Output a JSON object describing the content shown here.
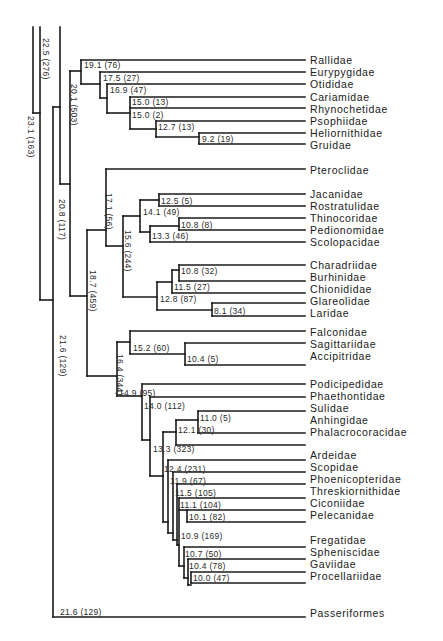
{
  "figure": {
    "type": "phylogenetic-tree",
    "taxa": [
      "Rallidae",
      "Eurypygidae",
      "Otididae",
      "Cariamidae",
      "Rhynochetidae",
      "Psophiidae",
      "Heliornithidae",
      "Gruidae",
      "Pteroclidae",
      "Jacanidae",
      "Rostratulidae",
      "Thinocoridae",
      "Pedionomidae",
      "Scolopacidae",
      "Charadriidae",
      "Burhinidae",
      "Chionididae",
      "Glareolidae",
      "Laridae",
      "Falconidae",
      "Sagittariidae",
      "Accipitridae",
      "Podicipedidae",
      "Phaethontidae",
      "Sulidae",
      "Anhingidae",
      "Phalacrocoracidae",
      "Ardeidae",
      "Scopidae",
      "Phoenicopteridae",
      "Threskiornithidae",
      "Ciconiidae",
      "Pelecanidae",
      "Fregatidae",
      "Spheniscidae",
      "Gaviidae",
      "Procellariidae",
      "Passeriformes"
    ],
    "node_labels": {
      "n191": "19.1 (76)",
      "n175": "17.5 (27)",
      "n169": "16.9 (47)",
      "n150a": "15.0 (13)",
      "n150b": "15.0 (2)",
      "n127": "12.7 (13)",
      "n92": "9.2 (19)",
      "n201": "20.1 (503)",
      "n225": "22.5 (276)",
      "n231": "23.1 (163)",
      "n208": "20.8 (117)",
      "n171": "17.1 (56)",
      "n156": "15.6 (244)",
      "n125": "12.5 (5)",
      "n141": "14.1 (49)",
      "n108a": "10.8 (8)",
      "n133a": "13.3 (46)",
      "n108b": "10.8 (32)",
      "n115a": "11.5 (27)",
      "n128": "12.8 (87)",
      "n81": "8.1 (34)",
      "n187": "18.7 (459)",
      "n152": "15.2 (60)",
      "n104a": "10.4 (5)",
      "n164": "16.4 (344)",
      "n149": "14.9 (95)",
      "n140": "14.0 (112)",
      "n110": "11.0 (5)",
      "n121": "12.1 (30)",
      "n133b": "13.3 (323)",
      "n124": "12.4 (231)",
      "n119": "11.9 (67)",
      "n115b": "11.5 (105)",
      "n111": "11.1 (104)",
      "n101": "10.1 (82)",
      "n109": "10.9 (169)",
      "n107": "10.7 (50)",
      "n104b": "10.4 (78)",
      "n100": "10.0 (47)",
      "n216a": "21.6 (129)",
      "n216b": "21.6 (129)"
    }
  }
}
